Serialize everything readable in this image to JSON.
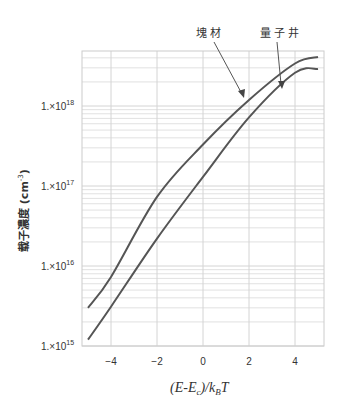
{
  "chart_data": {
    "type": "line",
    "title": "",
    "xlabel": "(E-E_c)/k_B T",
    "ylabel": "载子濃度 (cm^-3)",
    "yscale": "log",
    "xlim": [
      -5.26,
      5.26
    ],
    "ylim": [
      1000000000000000.0,
      4.9e+18
    ],
    "grid": true,
    "x_ticks": [
      -4,
      -2,
      0,
      2,
      4
    ],
    "x_tick_labels": [
      "-4",
      "-2",
      "0",
      "2",
      "4"
    ],
    "y_ticks": [
      1000000000000000.0,
      1e+16,
      1e+17,
      1e+18
    ],
    "y_tick_labels": [
      "1.×10^15",
      "1.×10^16",
      "1.×10^17",
      "1.×10^18"
    ],
    "x": [
      -5,
      -4,
      -2,
      0,
      2,
      4,
      5
    ],
    "series": [
      {
        "name": "塊材",
        "values": [
          3000000000000000.0,
          7300000000000000.0,
          7.3e+16,
          3.3e+17,
          1.19e+18,
          3.4e+18,
          4.1e+18
        ]
      },
      {
        "name": "量子井",
        "values": [
          1200000000000000.0,
          3100000000000000.0,
          2.2e+16,
          1.3e+17,
          7.2e+17,
          2.6e+18,
          2.9e+18
        ]
      }
    ],
    "annotations": [
      {
        "text": "塊材",
        "points_to_series": "塊材",
        "arrow_target_x": 1.74
      },
      {
        "text": "量子井",
        "points_to_series": "量子井",
        "arrow_target_x": 3.43
      }
    ],
    "legend": "none (inline arrow annotations)"
  },
  "labels": {
    "xlabel_main": "(E-E",
    "xlabel_sub_c": "c",
    "xlabel_mid": ")/k",
    "xlabel_sub_B": "B",
    "xlabel_end": "T",
    "ylabel_text": "载子濃度 (cm",
    "ylabel_sup": "-3",
    "ylabel_close": ")",
    "ann_bulk": "塊材",
    "ann_qw": "量子井",
    "ytick_prefix": "1.×10",
    "ytick_exps": [
      "15",
      "16",
      "17",
      "18"
    ],
    "xticks": [
      "−4",
      "−2",
      "0",
      "2",
      "4"
    ]
  },
  "colors": {
    "curve": "#555555",
    "grid": "#d4d4d4",
    "frame": "#cccccc",
    "arrow": "#555555"
  }
}
